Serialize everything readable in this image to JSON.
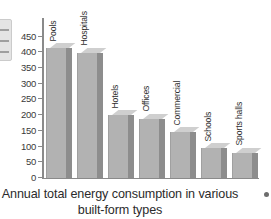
{
  "caption": {
    "line1": "Annual total energy consumption in various",
    "line2": "built-form types"
  },
  "axis": {
    "y_ticks": [
      "0",
      "50",
      "100",
      "150",
      "200",
      "250",
      "300",
      "350",
      "400",
      "450"
    ]
  },
  "chart_data": {
    "type": "bar",
    "title": "Annual total energy consumption in various built-form types",
    "xlabel": "",
    "ylabel": "",
    "ylim": [
      0,
      450
    ],
    "y_tick_step": 50,
    "grid": false,
    "legend": "none",
    "categories": [
      "Pools",
      "Hospitals",
      "Hotels",
      "Offices",
      "Commercial",
      "Schools",
      "Sports halls"
    ],
    "values": [
      412,
      398,
      200,
      188,
      145,
      95,
      80
    ],
    "bar_style": "3d-shaded-gray",
    "colors": {
      "bar_face": "#b2b2b2",
      "bar_side": "#8d8d8d",
      "bar_top": "#cfcfcf",
      "axis": "#8a8a8a",
      "text": "#2b2b2b"
    }
  },
  "artifacts": {
    "left_box": "page-edge-scan-fragment",
    "right_dot": "page-edge-ink-mark"
  }
}
